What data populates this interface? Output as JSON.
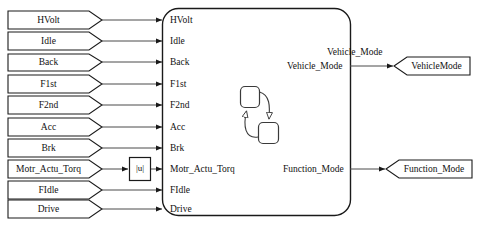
{
  "diagram": {
    "type": "simulink-stateflow-block-diagram",
    "background_color": "#ffffff",
    "line_color": "#1a1a1a",
    "shape_fill": "#ffffff"
  },
  "inputs": [
    {
      "label": "HVolt",
      "y": 20
    },
    {
      "label": "Idle",
      "y": 41
    },
    {
      "label": "Back",
      "y": 62
    },
    {
      "label": "F1st",
      "y": 84
    },
    {
      "label": "F2nd",
      "y": 105
    },
    {
      "label": "Acc",
      "y": 127
    },
    {
      "label": "Brk",
      "y": 148
    },
    {
      "label": "Motr_Actu_Torq",
      "y": 169
    },
    {
      "label": "FIdle",
      "y": 190
    },
    {
      "label": "Drive",
      "y": 209
    }
  ],
  "abs_block": {
    "label": "|u|",
    "name": "abs-block"
  },
  "chart": {
    "name": "stateflow-chart",
    "input_ports": [
      "HVolt",
      "Idle",
      "Back",
      "F1st",
      "F2nd",
      "Acc",
      "Brk",
      "Motr_Actu_Torq",
      "FIdle",
      "Drive"
    ],
    "output_ports": [
      "Vehicle_Mode",
      "Function_Mode"
    ],
    "states": [
      {
        "name": "state-a"
      },
      {
        "name": "state-b"
      }
    ]
  },
  "signal_labels": [
    {
      "label": "Vehicle_Mode"
    }
  ],
  "outputs": [
    {
      "label": "VehicleMode",
      "port": "Vehicle_Mode",
      "y": 66
    },
    {
      "label": "Function_Mode",
      "port": "Function_Mode",
      "y": 169
    }
  ]
}
